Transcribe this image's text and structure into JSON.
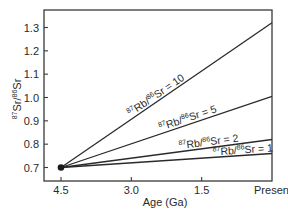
{
  "chart_data": {
    "type": "line",
    "title": "",
    "xlabel": "Age (Ga)",
    "ylabel": "87Sr/86Sr",
    "ylabel_parts": {
      "sup1": "87",
      "main1": "Sr/",
      "sup2": "86",
      "main2": "Sr"
    },
    "xlim": [
      4.5,
      0
    ],
    "ylim": [
      0.65,
      1.36
    ],
    "grid": false,
    "legend": "inline labels along lines",
    "x_ticks": [
      {
        "value": 4.5,
        "label": "4.5"
      },
      {
        "value": 3.0,
        "label": "3.0"
      },
      {
        "value": 1.5,
        "label": "1.5"
      },
      {
        "value": 0,
        "label": "Present"
      }
    ],
    "y_ticks": [
      {
        "value": 0.7,
        "label": "0.7"
      },
      {
        "value": 0.8,
        "label": "0.8"
      },
      {
        "value": 0.9,
        "label": "0.9"
      },
      {
        "value": 1.0,
        "label": "1.0"
      },
      {
        "value": 1.1,
        "label": "1.1"
      },
      {
        "value": 1.2,
        "label": "1.2"
      },
      {
        "value": 1.3,
        "label": "1.3"
      }
    ],
    "origin_point": {
      "age": 4.5,
      "value": 0.7
    },
    "series": [
      {
        "name": "87Rb/86Sr = 10",
        "ratio": "10",
        "x": [
          4.5,
          0
        ],
        "values": [
          0.7,
          1.32
        ]
      },
      {
        "name": "87Rb/86Sr = 5",
        "ratio": "5",
        "x": [
          4.5,
          0
        ],
        "values": [
          0.7,
          1.005
        ]
      },
      {
        "name": "87Rb/86Sr = 2",
        "ratio": "2",
        "x": [
          4.5,
          0
        ],
        "values": [
          0.7,
          0.82
        ]
      },
      {
        "name": "87Rb/86Sr = 1",
        "ratio": "1",
        "x": [
          4.5,
          0
        ],
        "values": [
          0.7,
          0.76
        ]
      }
    ],
    "series_label_parts": {
      "sup1": "87",
      "main1": "Rb/",
      "sup2": "86",
      "main2": "Sr = "
    }
  },
  "colors": {
    "line": "#2a2a2a",
    "axis": "#3a3a3a",
    "background": "#ffffff"
  }
}
